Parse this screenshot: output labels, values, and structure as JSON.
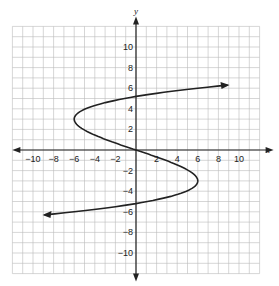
{
  "chart_data": {
    "type": "line",
    "title": "",
    "xlabel": "x",
    "ylabel": "y",
    "xlim": [
      -12,
      12
    ],
    "ylim": [
      -12,
      12
    ],
    "grid": true,
    "x_ticks": [
      "-10",
      "-8",
      "-6",
      "-4",
      "-2",
      "2",
      "4",
      "6",
      "8",
      "10"
    ],
    "y_ticks": [
      "10",
      "8",
      "6",
      "4",
      "2",
      "-2",
      "-4",
      "-6",
      "-8",
      "-10"
    ],
    "series": [
      {
        "name": "curve",
        "description": "S-shaped curve with arrows at both ends",
        "points": [
          [
            -12,
            -6.3
          ],
          [
            -6,
            -5.5
          ],
          [
            0,
            -5
          ],
          [
            4,
            -4.2
          ],
          [
            6,
            -3
          ],
          [
            4,
            -1.5
          ],
          [
            0,
            0
          ],
          [
            -4,
            1.5
          ],
          [
            -6,
            3
          ],
          [
            -4,
            4.2
          ],
          [
            0,
            5
          ],
          [
            6,
            5.5
          ],
          [
            11.5,
            6.3
          ]
        ]
      }
    ]
  }
}
